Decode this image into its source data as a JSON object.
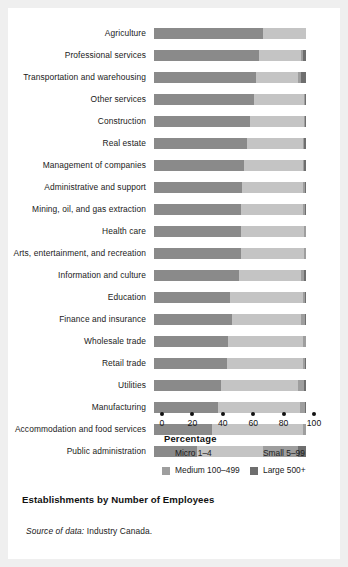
{
  "figure": {
    "caption": "Establishments by Number of Employees",
    "source_lead": "Source of data:",
    "source_text": "Industry Canada."
  },
  "axis": {
    "title": "Percentage",
    "ticks": [
      "0",
      "20",
      "40",
      "60",
      "80",
      "100"
    ]
  },
  "legend": [
    {
      "label": "Micro 1–4",
      "color": "#8a8a8a"
    },
    {
      "label": "Small 5–99",
      "color": "#c4c4c4"
    },
    {
      "label": "Medium 100–499",
      "color": "#9e9e9e"
    },
    {
      "label": "Large 500+",
      "color": "#6e6e6e"
    }
  ],
  "colors": {
    "micro": "#8a8a8a",
    "small": "#c4c4c4",
    "medium": "#9e9e9e",
    "large": "#6e6e6e",
    "background": "#ffffff",
    "page": "#efefef",
    "text": "#1a1a1a"
  },
  "chart_data": {
    "type": "bar",
    "orientation": "horizontal",
    "stacked": true,
    "title": "Establishments by Number of Employees",
    "xlabel": "Percentage",
    "ylabel": "",
    "xlim": [
      0,
      100
    ],
    "xticks": [
      0,
      20,
      40,
      60,
      80,
      100
    ],
    "grid": false,
    "legend_position": "below-axis",
    "categories": [
      "Agriculture",
      "Professional services",
      "Transportation and warehousing",
      "Other services",
      "Construction",
      "Real estate",
      "Management of companies",
      "Administrative and support",
      "Mining, oil, and gas extraction",
      "Health care",
      "Arts, entertainment, and recreation",
      "Information and culture",
      "Education",
      "Finance and insurance",
      "Wholesale trade",
      "Retail trade",
      "Utilities",
      "Manufacturing",
      "Accommodation and food services",
      "Public administration"
    ],
    "series": [
      {
        "name": "Micro 1–4",
        "color": "#8a8a8a",
        "values": [
          72,
          69,
          67,
          66,
          63,
          61,
          59,
          58,
          57,
          57,
          57,
          56,
          50,
          51,
          49,
          48,
          44,
          42,
          38,
          28
        ]
      },
      {
        "name": "Small 5–99",
        "color": "#c4c4c4",
        "values": [
          28,
          28,
          28,
          33,
          36,
          37,
          39,
          40,
          41,
          42,
          42,
          41,
          48,
          46,
          49,
          50,
          51,
          54,
          60,
          44
        ]
      },
      {
        "name": "Medium 100–499",
        "color": "#9e9e9e",
        "values": [
          0,
          1,
          2,
          0.5,
          0.6,
          1,
          1,
          1.3,
          1.5,
          0.8,
          0.8,
          2,
          1.5,
          2.2,
          1.7,
          1.6,
          4,
          3.5,
          1.8,
          23
        ]
      },
      {
        "name": "Large 500+",
        "color": "#6e6e6e",
        "values": [
          0,
          2,
          3,
          0.5,
          0.4,
          1,
          1,
          0.7,
          0.5,
          0.2,
          0.2,
          1,
          0.5,
          0.8,
          0.3,
          0.4,
          1,
          0.5,
          0.2,
          5
        ]
      }
    ]
  }
}
